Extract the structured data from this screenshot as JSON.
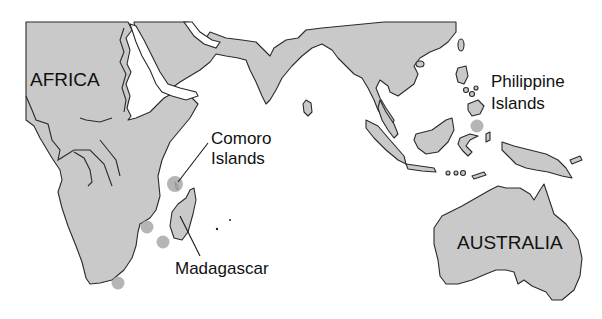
{
  "map": {
    "labels": {
      "africa": "AFRICA",
      "comoro_line1": "Comoro",
      "comoro_line2": "Islands",
      "philippine_line1": "Philippine",
      "philippine_line2": "Islands",
      "madagascar": "Madagascar",
      "australia": "AUSTRALIA"
    },
    "colors": {
      "land": "#c9c9c9",
      "outline": "#2a2a2a",
      "marker": "#a8a8a8",
      "water": "#ffffff"
    },
    "markers": [
      {
        "name": "comoro-islands",
        "x": 175,
        "y": 184
      },
      {
        "name": "mozambique-coast",
        "x": 147,
        "y": 227
      },
      {
        "name": "mozambique-channel-south",
        "x": 163,
        "y": 242
      },
      {
        "name": "south-africa-tip",
        "x": 118,
        "y": 283
      },
      {
        "name": "philippines-south",
        "x": 477,
        "y": 126
      }
    ]
  }
}
